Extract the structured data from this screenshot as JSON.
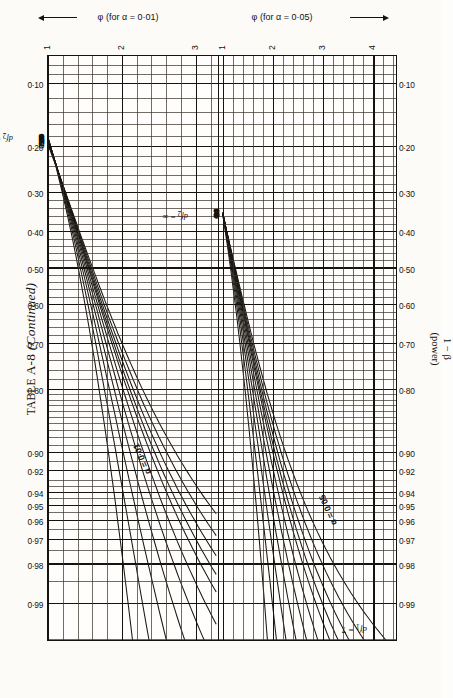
{
  "title": {
    "prefix": "TABLE",
    "number": "A-8",
    "suffix": "(Continued)"
  },
  "chart_data": {
    "type": "line",
    "title": "TABLE A-8 (Continued)",
    "ylabel": "1 − β (power)",
    "xlabel_alpha01": "φ (for α = 0·01)",
    "xlabel_alpha05": "φ (for α = 0·05)",
    "numerator_df_label": "df₁ = 7",
    "denominator_df_label": "df₂ = ∞",
    "alpha_annotations": [
      "α = 0·01",
      "α = 0·05"
    ],
    "power_ticks": [
      "0·99",
      "0·98",
      "0·97",
      "0·96",
      "0·95",
      "0·94",
      "0·92",
      "0·90",
      "0·80",
      "0·70",
      "0·60",
      "0·50",
      "0·40",
      "0·30",
      "0·20",
      "0·10"
    ],
    "power_values": [
      0.99,
      0.98,
      0.97,
      0.96,
      0.95,
      0.94,
      0.92,
      0.9,
      0.8,
      0.7,
      0.6,
      0.5,
      0.4,
      0.3,
      0.2,
      0.1
    ],
    "phi_ticks_alpha01": [
      "1",
      "2",
      "3"
    ],
    "phi_ticks_alpha05": [
      "1",
      "2",
      "3",
      "4"
    ],
    "phi_range_alpha01": [
      1,
      3
    ],
    "phi_range_alpha05": [
      1,
      4
    ],
    "grid": true,
    "legend": "curve labels are df2 (denominator degrees of freedom)",
    "curve_labels_alpha01": [
      "6",
      "7",
      "8",
      "9",
      "10",
      "12",
      "15",
      "20",
      "30",
      "60",
      "∞"
    ],
    "curve_labels_alpha05": [
      "6",
      "7",
      "8",
      "9",
      "10",
      "12",
      "15",
      "20",
      "30",
      "60",
      "∞"
    ],
    "df2_values": [
      6,
      7,
      8,
      9,
      10,
      12,
      15,
      20,
      30,
      60,
      "∞"
    ],
    "panels": [
      {
        "alpha": 0.01,
        "phi_min": 1,
        "phi_max": 3,
        "note": "right-hand family of curves"
      },
      {
        "alpha": 0.05,
        "phi_min": 1,
        "phi_max": 4,
        "note": "left-hand family of curves"
      }
    ]
  }
}
